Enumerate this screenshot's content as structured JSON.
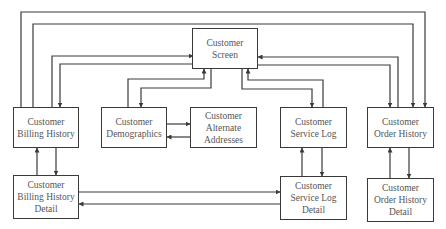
{
  "diagram": {
    "type": "flowchart",
    "nodes": [
      {
        "id": "screen",
        "label": "Customer\nScreen"
      },
      {
        "id": "billing",
        "label": "Customer\nBilling History"
      },
      {
        "id": "demographics",
        "label": "Customer\nDemographics"
      },
      {
        "id": "alternate",
        "label": "Customer\nAlternate\nAddresses"
      },
      {
        "id": "service",
        "label": "Customer\nService Log"
      },
      {
        "id": "order",
        "label": "Customer\nOrder History"
      },
      {
        "id": "billing_detail",
        "label": "Customer\nBilling History\nDetail"
      },
      {
        "id": "service_detail",
        "label": "Customer\nService Log\nDetail"
      },
      {
        "id": "order_detail",
        "label": "Customer\nOrder History\nDetail"
      }
    ],
    "edges": [
      {
        "from": "billing",
        "to": "screen"
      },
      {
        "from": "screen",
        "to": "billing"
      },
      {
        "from": "billing",
        "to": "order"
      },
      {
        "from": "billing",
        "to": "order"
      },
      {
        "from": "demographics",
        "to": "screen"
      },
      {
        "from": "screen",
        "to": "demographics"
      },
      {
        "from": "demographics",
        "to": "alternate"
      },
      {
        "from": "alternate",
        "to": "demographics"
      },
      {
        "from": "service",
        "to": "screen"
      },
      {
        "from": "screen",
        "to": "service"
      },
      {
        "from": "order",
        "to": "screen"
      },
      {
        "from": "screen",
        "to": "order"
      },
      {
        "from": "billing_detail",
        "to": "billing"
      },
      {
        "from": "billing",
        "to": "billing_detail"
      },
      {
        "from": "service_detail",
        "to": "service"
      },
      {
        "from": "service",
        "to": "service_detail"
      },
      {
        "from": "order_detail",
        "to": "order"
      },
      {
        "from": "order",
        "to": "order_detail"
      },
      {
        "from": "billing_detail",
        "to": "service_detail"
      },
      {
        "from": "service_detail",
        "to": "billing_detail"
      }
    ],
    "colors": {
      "line": "#3a3a3a",
      "text": "#555555",
      "background": "#ffffff"
    }
  }
}
